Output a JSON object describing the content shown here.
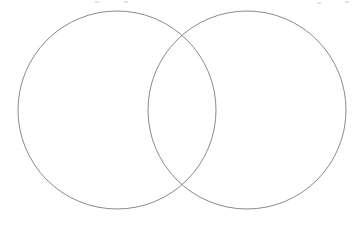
{
  "figure": {
    "type": "venn-diagram",
    "title": "",
    "set_count": 2,
    "background_color": "#ffffff",
    "stroke_color": "#8a8a8a",
    "stroke_width": 1,
    "canvas": {
      "width": 362,
      "height": 228
    }
  },
  "circles": [
    {
      "id": "left",
      "label": "",
      "cx": 117,
      "cy": 110,
      "r": 99,
      "stroke_color": "#8a8a8a"
    },
    {
      "id": "right",
      "label": "",
      "cx": 247,
      "cy": 110,
      "r": 99,
      "stroke_color": "#8a8a8a"
    }
  ],
  "regions": [
    {
      "id": "left-only",
      "label": "",
      "cx": 75,
      "cy": 110
    },
    {
      "id": "intersection",
      "label": "",
      "cx": 182,
      "cy": 110
    },
    {
      "id": "right-only",
      "label": "",
      "cx": 289,
      "cy": 110
    }
  ],
  "intersection_points": [
    {
      "x": 182,
      "y": 32
    },
    {
      "x": 182,
      "y": 190
    }
  ],
  "artifacts": [
    {
      "x": 95,
      "y": 1,
      "width": 4,
      "height": 2
    },
    {
      "x": 124,
      "y": 1,
      "width": 4,
      "height": 2
    },
    {
      "x": 317,
      "y": 2,
      "width": 4,
      "height": 2
    },
    {
      "x": 345,
      "y": 1,
      "width": 4,
      "height": 2
    }
  ]
}
